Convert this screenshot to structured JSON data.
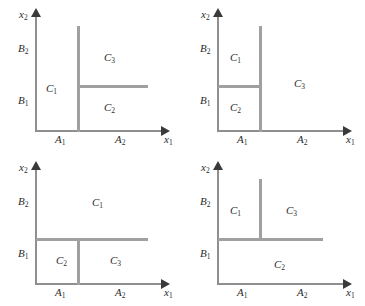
{
  "figure": {
    "kind": "four-panel-partition-diagram",
    "panel_count": 4,
    "line_color": "#a0a0a0",
    "axis_color": "#8f8f8f",
    "text_color": "#2b2b2b",
    "background": "#ffffff"
  },
  "axes": {
    "x_name": "x",
    "x_sub": "1",
    "y_name": "x",
    "y_sub": "2"
  },
  "ticks": {
    "x": [
      {
        "name": "A",
        "sub": "1"
      },
      {
        "name": "A",
        "sub": "2"
      }
    ],
    "y": [
      {
        "name": "B",
        "sub": "1"
      },
      {
        "name": "B",
        "sub": "2"
      }
    ]
  },
  "classes": {
    "c1": {
      "name": "C",
      "sub": "1"
    },
    "c2": {
      "name": "C",
      "sub": "2"
    },
    "c3": {
      "name": "C",
      "sub": "3"
    }
  },
  "panels": [
    {
      "id": "top-left",
      "position": "top-left",
      "description": "Vertical divider at A1/A2 boundary spanning full height; horizontal divider to its right at B1/B2 boundary. C1 occupies the left strip, C3 the upper right, C2 the lower right.",
      "regions": [
        {
          "class": "c1",
          "label_x": 46,
          "label_y": 82
        },
        {
          "class": "c2",
          "label_x": 104,
          "label_y": 101
        },
        {
          "class": "c3",
          "label_x": 104,
          "label_y": 51
        }
      ],
      "dividers": [
        {
          "orient": "vertical",
          "x": 77,
          "y": 26,
          "length": 106
        },
        {
          "orient": "horizontal",
          "x": 77,
          "y": 85,
          "length": 71
        }
      ]
    },
    {
      "id": "top-right",
      "position": "top-right",
      "description": "Vertical divider at A1/A2 boundary spanning full height; horizontal divider to its left at B1/B2 boundary. C1 upper left, C2 lower left, C3 the whole right strip.",
      "regions": [
        {
          "class": "c1",
          "label_x": 48,
          "label_y": 51
        },
        {
          "class": "c2",
          "label_x": 48,
          "label_y": 101
        },
        {
          "class": "c3",
          "label_x": 112,
          "label_y": 77
        }
      ],
      "dividers": [
        {
          "orient": "vertical",
          "x": 77,
          "y": 26,
          "length": 106
        },
        {
          "orient": "horizontal",
          "x": 36,
          "y": 85,
          "length": 44
        }
      ]
    },
    {
      "id": "bottom-left",
      "position": "bottom-left",
      "description": "Horizontal divider at B1/B2 boundary spanning the width; vertical stub below it at the A1/A2 boundary. C1 fills the upper band, C2 lower left, C3 lower right.",
      "regions": [
        {
          "class": "c1",
          "label_x": 92,
          "label_y": 43
        },
        {
          "class": "c2",
          "label_x": 56,
          "label_y": 101
        },
        {
          "class": "c3",
          "label_x": 110,
          "label_y": 101
        }
      ],
      "dividers": [
        {
          "orient": "horizontal",
          "x": 36,
          "y": 85,
          "length": 112
        },
        {
          "orient": "vertical",
          "x": 77,
          "y": 85,
          "length": 47
        }
      ]
    },
    {
      "id": "bottom-right",
      "position": "bottom-right",
      "description": "Horizontal divider at B1/B2 boundary; vertical stub rising above it at the A1/A2 boundary. C1 upper left, C3 upper right, C2 fills the lower band.",
      "regions": [
        {
          "class": "c1",
          "label_x": 48,
          "label_y": 51
        },
        {
          "class": "c3",
          "label_x": 104,
          "label_y": 51
        },
        {
          "class": "c2",
          "label_x": 92,
          "label_y": 105
        }
      ],
      "dividers": [
        {
          "orient": "horizontal",
          "x": 36,
          "y": 85,
          "length": 105
        },
        {
          "orient": "vertical",
          "x": 77,
          "y": 26,
          "length": 62
        }
      ]
    }
  ]
}
